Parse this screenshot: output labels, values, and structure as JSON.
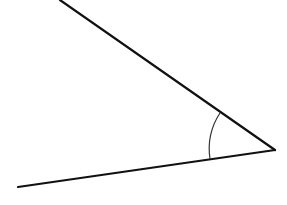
{
  "diagram": {
    "type": "angle",
    "background": "#ffffff",
    "stroke_color": "#111111",
    "vertex": {
      "x": 275,
      "y": 150
    },
    "ray_upper": {
      "x1": 60,
      "y1": 0,
      "x2": 275,
      "y2": 150,
      "width": 2.2
    },
    "ray_lower": {
      "x1": 18,
      "y1": 187,
      "x2": 275,
      "y2": 150,
      "width": 2.2
    },
    "arc": {
      "start": {
        "x": 220,
        "y": 113
      },
      "end": {
        "x": 210,
        "y": 159
      },
      "radius": 66,
      "width": 1.2,
      "color": "#333333"
    }
  }
}
